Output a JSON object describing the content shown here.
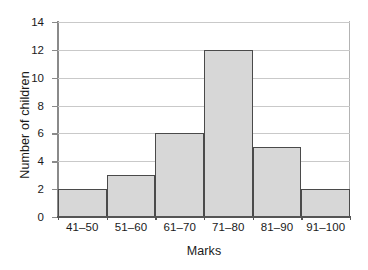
{
  "chart_data": {
    "type": "bar",
    "title": "",
    "xlabel": "Marks",
    "ylabel": "Number of children",
    "categories": [
      "41–50",
      "51–60",
      "61–70",
      "71–80",
      "81–90",
      "91–100"
    ],
    "values": [
      2,
      3,
      6,
      12,
      5,
      2
    ],
    "ylim": [
      0,
      14
    ],
    "yticks": [
      0,
      2,
      4,
      6,
      8,
      10,
      12,
      14
    ],
    "ytick_labels": [
      "0",
      "2",
      "4",
      "6",
      "8",
      "10",
      "12",
      "14"
    ],
    "grid": true,
    "grid_axis": "y",
    "legend": false,
    "legend_position": "none",
    "bar_fill_color": "#d7d7d7",
    "bar_edge_color": "#4a4a4a",
    "grid_color": "#c9c9c9",
    "axis_color": "#555555",
    "background_color": "#ffffff"
  }
}
